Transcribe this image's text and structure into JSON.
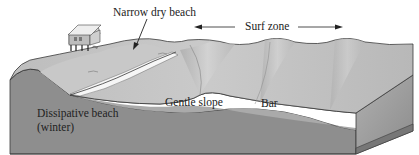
{
  "diagram": {
    "labels": {
      "narrow_dry_beach": "Narrow dry beach",
      "surf_zone": "Surf zone",
      "gentle_slope": "Gentle slope",
      "bar": "Bar",
      "beach_type_line1": "Dissipative beach",
      "beach_type_line2": "(winter)"
    },
    "icons": {
      "house": "beach-house-on-stilts",
      "arrow_pointer": "arrow-to-dry-beach",
      "double_arrow": "surf-zone-extent-arrows"
    },
    "colors": {
      "block_front": "#8a8a8a",
      "block_side": "#9d9d9d",
      "surface_top": "#c4c4c4",
      "surf_foam": "#f4f4f4",
      "outline": "#3a3a3a"
    }
  }
}
